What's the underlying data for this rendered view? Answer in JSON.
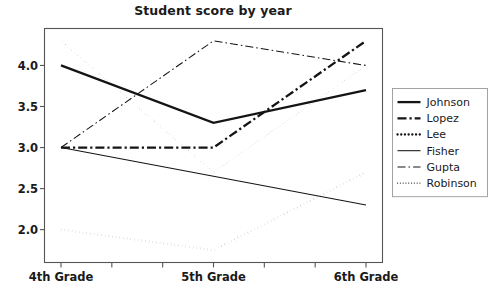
{
  "chart_data": {
    "type": "line",
    "title": "Student score by year",
    "xlabel": "",
    "ylabel": "",
    "categories": [
      "4th Grade",
      "5th Grade",
      "6th Grade"
    ],
    "ylim": [
      1.6,
      4.45
    ],
    "yticks": [
      "2.0",
      "2.5",
      "3.0",
      "3.5",
      "4.0"
    ],
    "ytick_values": [
      2.0,
      2.5,
      3.0,
      3.5,
      4.0
    ],
    "grid": false,
    "legend_position": "right",
    "series": [
      {
        "name": "Johnson",
        "values": [
          4.0,
          3.3,
          3.7
        ],
        "style": "solid",
        "width": "thick"
      },
      {
        "name": "Lopez",
        "values": [
          3.0,
          3.0,
          4.3
        ],
        "style": "dashdot",
        "width": "thick"
      },
      {
        "name": "Lee",
        "values": [
          2.0,
          1.75,
          2.7
        ],
        "style": "dotted",
        "width": "thick"
      },
      {
        "name": "Fisher",
        "values": [
          3.0,
          2.65,
          2.3
        ],
        "style": "solid",
        "width": "thin"
      },
      {
        "name": "Gupta",
        "values": [
          3.0,
          4.3,
          4.0
        ],
        "style": "dashdot",
        "width": "thin"
      },
      {
        "name": "Robinson",
        "values": [
          4.3,
          2.7,
          4.0
        ],
        "style": "dotted",
        "width": "thin"
      }
    ],
    "line_color": "#141414",
    "frame_color": "#555555",
    "background": "#ffffff"
  },
  "legend": {
    "items": [
      {
        "label": "Johnson"
      },
      {
        "label": "Lopez"
      },
      {
        "label": "Lee"
      },
      {
        "label": "Fisher"
      },
      {
        "label": "Gupta"
      },
      {
        "label": "Robinson"
      }
    ]
  }
}
